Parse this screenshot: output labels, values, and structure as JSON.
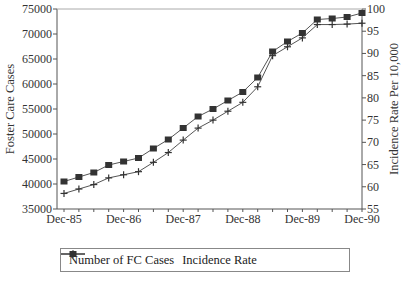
{
  "chart_data": {
    "type": "line",
    "title": "",
    "xlabel": "",
    "ylabel": "Foster Care Cases",
    "y2label": "Incidence Rate Per 10,000",
    "ylim": [
      35000,
      75000
    ],
    "y2lim": [
      55,
      100
    ],
    "yticks": [
      35000,
      40000,
      45000,
      50000,
      55000,
      60000,
      65000,
      70000,
      75000
    ],
    "y2ticks": [
      55,
      60,
      65,
      70,
      75,
      80,
      85,
      90,
      95,
      100
    ],
    "xtick_labels": [
      "Dec-85",
      "Dec-86",
      "Dec-87",
      "Dec-88",
      "Dec-89",
      "Dec-90"
    ],
    "x": [
      "Dec-85",
      "Mar-86",
      "Jun-86",
      "Sep-86",
      "Dec-86",
      "Mar-87",
      "Jun-87",
      "Sep-87",
      "Dec-87",
      "Mar-88",
      "Jun-88",
      "Sep-88",
      "Dec-88",
      "Mar-89",
      "Jun-89",
      "Sep-89",
      "Dec-89",
      "Mar-90",
      "Jun-90",
      "Sep-90",
      "Dec-90"
    ],
    "series": [
      {
        "name": "Number of FC Cases",
        "axis": "left",
        "marker": "square",
        "values": [
          40500,
          41400,
          42300,
          43800,
          44500,
          45200,
          47100,
          48900,
          51200,
          53500,
          55000,
          56700,
          58400,
          61300,
          66500,
          68500,
          70200,
          72900,
          73100,
          73400,
          74200
        ]
      },
      {
        "name": "Incidence Rate",
        "axis": "right",
        "marker": "plus",
        "values": [
          58.5,
          59.5,
          60.5,
          62,
          62.7,
          63.4,
          65.5,
          67.7,
          70.5,
          73.2,
          75,
          77,
          79,
          82.5,
          89.5,
          91.5,
          93.5,
          96.5,
          96.5,
          96.6,
          96.8
        ]
      }
    ],
    "legend_position": "bottom",
    "grid": false
  },
  "legend": {
    "items": [
      {
        "label": "Number of FC Cases"
      },
      {
        "label": "Incidence Rate"
      }
    ]
  }
}
